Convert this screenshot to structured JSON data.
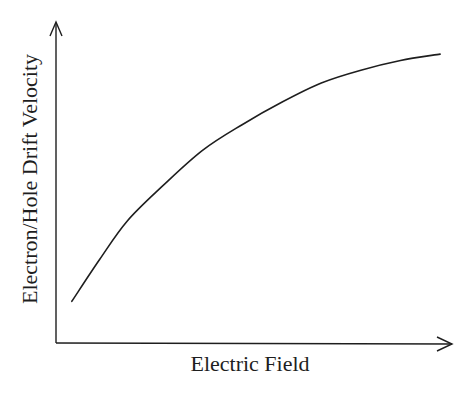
{
  "chart_data": {
    "type": "line",
    "title": "",
    "xlabel": "Electric Field",
    "ylabel": "Electron/Hole Drift Velocity",
    "grid": false,
    "legend": null,
    "ticks": {
      "x": [],
      "y": []
    },
    "series": [
      {
        "name": "Drift velocity",
        "x": [
          0.04,
          0.11,
          0.18,
          0.27,
          0.37,
          0.47,
          0.57,
          0.67,
          0.77,
          0.87,
          0.97
        ],
        "y": [
          0.13,
          0.26,
          0.38,
          0.49,
          0.6,
          0.68,
          0.75,
          0.81,
          0.85,
          0.88,
          0.9
        ]
      }
    ],
    "xlim": [
      0,
      1
    ],
    "ylim": [
      0,
      1
    ]
  },
  "axes": {
    "x_label": "Electric Field",
    "y_label": "Electron/Hole Drift Velocity"
  },
  "colors": {
    "ink": "#1e1e1e",
    "background": "#ffffff"
  }
}
